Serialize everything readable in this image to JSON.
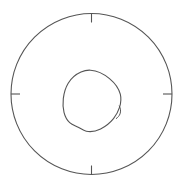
{
  "figure": {
    "title": "Pole Figure Stereographic Projection",
    "background_color": "#ffffff",
    "line_color": "#555555",
    "width": 184,
    "height": 188
  },
  "outer_circle": {
    "name": "projection-boundary",
    "center_x": 91.5,
    "center_y": 94,
    "radius": 80.5,
    "stroke_width": 1.1,
    "color": "#555555"
  },
  "ticks": [
    {
      "label": "north-tick",
      "angle_deg": 90,
      "position": "top",
      "length": 9,
      "direction": "inward"
    },
    {
      "label": "east-tick",
      "angle_deg": 0,
      "position": "right",
      "length": 9,
      "direction": "inward"
    },
    {
      "label": "south-tick",
      "angle_deg": 270,
      "position": "bottom",
      "length": 9,
      "direction": "inward"
    },
    {
      "label": "west-tick",
      "angle_deg": 180,
      "position": "left",
      "length": 9,
      "direction": "inward"
    }
  ],
  "contour": {
    "name": "inner-contour",
    "type": "closed-irregular-blob",
    "centroid_x": 91,
    "centroid_y": 100,
    "bbox": {
      "x_min": 63,
      "y_min": 70,
      "x_max": 121,
      "y_max": 132
    },
    "path": "M 90.5 70.2 C 97.5 70.6 104.0 74.0 109.5 78.6 C 114.8 83.0 118.8 88.2 120.3 94.2 C 121.4 98.6 120.9 103.0 119.6 107.2 C 118.3 111.4 116.2 115.3 113.5 118.7 C 110.0 123.0 105.6 126.6 100.6 129.0 C 96.0 131.2 91.0 132.2 86.3 131.2 C 83.3 130.5 80.9 128.6 78.2 127.2 C 75.3 125.7 72.2 124.8 69.7 122.6 C 66.8 120.0 65.0 116.2 64.0 112.3 C 62.9 107.9 62.8 103.2 63.3 98.6 C 63.9 93.2 65.4 87.8 68.2 83.2 C 71.2 78.3 75.7 74.3 81.0 72.0 C 84.0 70.7 87.2 70.0 90.5 70.2 Z",
    "notch": {
      "name": "right-edge-notch",
      "path": "M 119.3 106.0 C 120.6 108.4 121.0 111.3 120.0 113.9 C 119.3 115.8 117.9 117.4 116.3 118.5"
    }
  },
  "legend": {
    "visible": false,
    "entries": []
  },
  "annotations": {
    "visible": false,
    "items": []
  },
  "chart_data": {
    "type": "line",
    "title": "",
    "xlabel": "",
    "ylabel": "",
    "grid": false,
    "legend_position": "none",
    "series": [
      {
        "name": "projection-boundary",
        "closed": true,
        "shape": "circle",
        "center": [
          91.5,
          94
        ],
        "radius": 80.5
      },
      {
        "name": "inner-contour",
        "closed": true,
        "shape": "irregular",
        "points": [
          [
            90.5,
            70.2
          ],
          [
            97.5,
            70.6
          ],
          [
            104.0,
            74.0
          ],
          [
            109.5,
            78.6
          ],
          [
            114.8,
            83.0
          ],
          [
            118.8,
            88.2
          ],
          [
            120.3,
            94.2
          ],
          [
            121.4,
            98.6
          ],
          [
            120.9,
            103.0
          ],
          [
            119.6,
            107.2
          ],
          [
            118.3,
            111.4
          ],
          [
            116.2,
            115.3
          ],
          [
            113.5,
            118.7
          ],
          [
            110.0,
            123.0
          ],
          [
            105.6,
            126.6
          ],
          [
            100.6,
            129.0
          ],
          [
            96.0,
            131.2
          ],
          [
            91.0,
            132.2
          ],
          [
            86.3,
            131.2
          ],
          [
            83.3,
            130.5
          ],
          [
            80.9,
            128.6
          ],
          [
            78.2,
            127.2
          ],
          [
            75.3,
            125.7
          ],
          [
            72.2,
            124.8
          ],
          [
            69.7,
            122.6
          ],
          [
            66.8,
            120.0
          ],
          [
            65.0,
            116.2
          ],
          [
            64.0,
            112.3
          ],
          [
            62.9,
            107.9
          ],
          [
            62.8,
            103.2
          ],
          [
            63.3,
            98.6
          ],
          [
            63.9,
            93.2
          ],
          [
            65.4,
            87.8
          ],
          [
            68.2,
            83.2
          ],
          [
            71.2,
            78.3
          ],
          [
            75.7,
            74.3
          ],
          [
            81.0,
            72.0
          ],
          [
            84.0,
            70.7
          ],
          [
            87.2,
            70.0
          ]
        ]
      }
    ],
    "tick_angles_deg": [
      0,
      90,
      180,
      270
    ],
    "axis_ranges": {
      "x": [
        11,
        172
      ],
      "y": [
        13.5,
        174.5
      ]
    }
  }
}
